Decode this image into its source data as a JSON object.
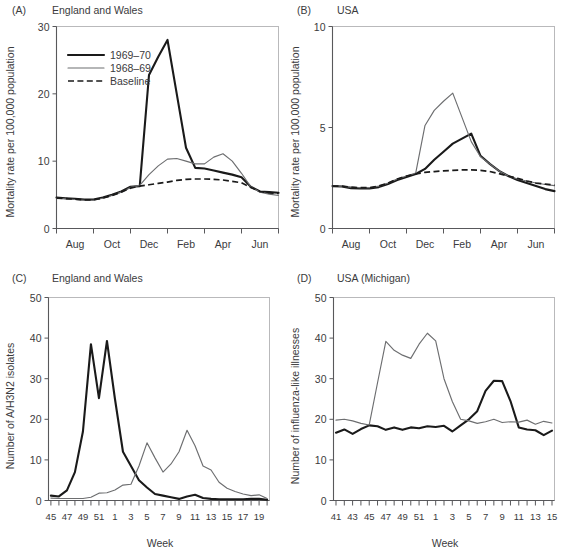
{
  "figure": {
    "panel_tags": {
      "a": "(A)",
      "b": "(B)",
      "c": "(C)",
      "d": "(D)"
    }
  },
  "legend": {
    "items": [
      {
        "label": "1969–70",
        "style": "thick-black",
        "color": "#1a1a1a"
      },
      {
        "label": "1968–69",
        "style": "thin-gray",
        "color": "#6d6e70"
      },
      {
        "label": "Baseline",
        "style": "dashed-black",
        "color": "#1a1a1a"
      }
    ]
  },
  "chart_data": [
    {
      "id": "panel-a",
      "type": "line",
      "panel": "(A)",
      "title": "England and Wales",
      "xlabel": "",
      "ylabel": "Mortality rate per 100,000 population",
      "ylim": [
        0,
        30
      ],
      "yticks": [
        0,
        10,
        20,
        30
      ],
      "ytick_labels": [
        "0",
        "10",
        "20",
        "30"
      ],
      "xlim": [
        0,
        12
      ],
      "xtick_positions": [
        0,
        2,
        4,
        6,
        8,
        10,
        12
      ],
      "xtick_labels": [
        "Aug",
        "Oct",
        "Dec",
        "Feb",
        "Apr",
        "Jun"
      ],
      "xtick_label_positions": [
        1,
        3,
        5,
        7,
        9,
        11
      ],
      "grid": false,
      "legend_position": "upper-left",
      "x": [
        0,
        0.5,
        1,
        1.5,
        2,
        2.5,
        3,
        3.5,
        4,
        4.5,
        5,
        5.5,
        6,
        6.5,
        7,
        7.5,
        8,
        8.5,
        9,
        9.5,
        10,
        10.5,
        11,
        11.5,
        12
      ],
      "series": [
        {
          "name": "1969–70",
          "style": "thick-black",
          "values": [
            4.6,
            4.5,
            4.4,
            4.3,
            4.3,
            4.6,
            5.0,
            5.5,
            6.2,
            6.3,
            22.8,
            25.5,
            28.0,
            20.0,
            12.0,
            9.0,
            8.9,
            8.6,
            8.3,
            8.0,
            7.6,
            6.2,
            5.5,
            5.4,
            5.3
          ]
        },
        {
          "name": "1968–69",
          "style": "thin-gray",
          "values": [
            4.5,
            4.4,
            4.3,
            4.2,
            4.2,
            4.5,
            4.9,
            5.4,
            6.1,
            6.4,
            8.0,
            9.3,
            10.3,
            10.4,
            10.0,
            9.6,
            9.6,
            10.6,
            11.1,
            10.0,
            8.2,
            6.2,
            5.4,
            5.1,
            4.9
          ]
        },
        {
          "name": "Baseline",
          "style": "dashed-black",
          "values": [
            4.5,
            4.45,
            4.35,
            4.25,
            4.25,
            4.5,
            4.9,
            5.4,
            6.0,
            6.3,
            6.5,
            6.7,
            6.9,
            7.15,
            7.3,
            7.35,
            7.35,
            7.3,
            7.2,
            7.0,
            6.8,
            6.1,
            5.5,
            5.3,
            5.2
          ]
        }
      ]
    },
    {
      "id": "panel-b",
      "type": "line",
      "panel": "(B)",
      "title": "USA",
      "xlabel": "",
      "ylabel": "Mortality rate per 100,000 population",
      "ylim": [
        0,
        10
      ],
      "yticks": [
        0,
        5,
        10
      ],
      "ytick_labels": [
        "0",
        "5",
        "10"
      ],
      "xlim": [
        0,
        12
      ],
      "xtick_positions": [
        0,
        2,
        4,
        6,
        8,
        10,
        12
      ],
      "xtick_labels": [
        "Aug",
        "Oct",
        "Dec",
        "Feb",
        "Apr",
        "Jun"
      ],
      "xtick_label_positions": [
        1,
        3,
        5,
        7,
        9,
        11
      ],
      "grid": false,
      "legend_position": "none",
      "x": [
        0,
        0.5,
        1,
        1.5,
        2,
        2.5,
        3,
        3.5,
        4,
        4.5,
        5,
        5.5,
        6,
        6.5,
        7,
        7.5,
        8,
        8.5,
        9,
        9.5,
        10,
        10.5,
        11,
        11.5,
        12
      ],
      "series": [
        {
          "name": "1969–70",
          "style": "thick-black",
          "values": [
            2.1,
            2.08,
            2.0,
            1.98,
            1.98,
            2.05,
            2.2,
            2.4,
            2.55,
            2.7,
            2.95,
            3.4,
            3.8,
            4.2,
            4.45,
            4.7,
            3.6,
            3.2,
            2.85,
            2.6,
            2.4,
            2.25,
            2.1,
            1.95,
            1.85
          ]
        },
        {
          "name": "1968–69",
          "style": "thin-gray",
          "values": [
            2.1,
            2.1,
            2.05,
            2.02,
            2.02,
            2.1,
            2.25,
            2.45,
            2.6,
            2.75,
            5.1,
            5.85,
            6.3,
            6.7,
            5.5,
            4.3,
            3.55,
            3.2,
            2.85,
            2.6,
            2.45,
            2.35,
            2.25,
            2.18,
            2.12
          ]
        },
        {
          "name": "Baseline",
          "style": "dashed-black",
          "values": [
            2.1,
            2.1,
            2.05,
            2.02,
            2.02,
            2.1,
            2.25,
            2.45,
            2.6,
            2.7,
            2.78,
            2.82,
            2.85,
            2.88,
            2.9,
            2.9,
            2.88,
            2.82,
            2.72,
            2.6,
            2.48,
            2.35,
            2.25,
            2.2,
            2.15
          ]
        }
      ]
    },
    {
      "id": "panel-c",
      "type": "line",
      "panel": "(C)",
      "title": "England and Wales",
      "xlabel": "Week",
      "ylabel": "Number of A/H3N2 isolates",
      "ylim": [
        0,
        50
      ],
      "yticks": [
        0,
        10,
        20,
        30,
        40,
        50
      ],
      "ytick_labels": [
        "0",
        "10",
        "20",
        "30",
        "40",
        "50"
      ],
      "xtick_labels": [
        "45",
        "47",
        "49",
        "51",
        "1",
        "3",
        "5",
        "7",
        "9",
        "11",
        "13",
        "15",
        "17",
        "19"
      ],
      "week_sequence": [
        45,
        46,
        47,
        48,
        49,
        50,
        51,
        52,
        1,
        2,
        3,
        4,
        5,
        6,
        7,
        8,
        9,
        10,
        11,
        12,
        13,
        14,
        15,
        16,
        17,
        18,
        19,
        20
      ],
      "grid": false,
      "legend_position": "none",
      "series": [
        {
          "name": "1969–70",
          "style": "thick-black",
          "values": [
            1.2,
            1.0,
            2.5,
            7.0,
            17.0,
            38.5,
            25.2,
            39.3,
            25.0,
            12.0,
            8.5,
            5.0,
            3.2,
            1.6,
            1.2,
            0.8,
            0.4,
            1.0,
            1.4,
            0.6,
            0.4,
            0.3,
            0.3,
            0.3,
            0.3,
            0.4,
            0.4,
            0.2
          ]
        },
        {
          "name": "1968–69",
          "style": "thin-gray",
          "values": [
            0.6,
            0.5,
            0.5,
            0.5,
            0.5,
            0.8,
            1.8,
            1.9,
            2.6,
            3.8,
            4.0,
            8.5,
            14.2,
            10.5,
            7.0,
            9.0,
            12.0,
            17.3,
            13.5,
            8.5,
            7.5,
            4.5,
            3.0,
            2.2,
            1.6,
            1.2,
            1.4,
            0.5
          ]
        }
      ]
    },
    {
      "id": "panel-d",
      "type": "line",
      "panel": "(D)",
      "title": "USA (Michigan)",
      "xlabel": "Week",
      "ylabel": "Number of influenza-like illnesses",
      "ylim": [
        0,
        50
      ],
      "yticks": [
        0,
        10,
        20,
        30,
        40,
        50
      ],
      "ytick_labels": [
        "0",
        "10",
        "20",
        "30",
        "40",
        "50"
      ],
      "xtick_labels": [
        "41",
        "43",
        "45",
        "47",
        "49",
        "51",
        "1",
        "3",
        "5",
        "7",
        "9",
        "11",
        "13",
        "15"
      ],
      "week_sequence": [
        41,
        42,
        43,
        44,
        45,
        46,
        47,
        48,
        49,
        50,
        51,
        52,
        1,
        2,
        3,
        4,
        5,
        6,
        7,
        8,
        9,
        10,
        11,
        12,
        13,
        14,
        15
      ],
      "grid": false,
      "legend_position": "none",
      "series": [
        {
          "name": "1969–70",
          "style": "thick-black",
          "values": [
            16.7,
            17.5,
            16.4,
            17.6,
            18.5,
            18.3,
            17.4,
            18.0,
            17.4,
            18.0,
            17.8,
            18.3,
            18.1,
            18.4,
            17.0,
            18.5,
            20.0,
            22.0,
            27.0,
            29.5,
            29.4,
            24.5,
            18.0,
            17.5,
            17.3,
            16.1,
            17.2
          ]
        },
        {
          "name": "1968–69",
          "style": "thin-gray",
          "values": [
            19.8,
            20.0,
            19.6,
            19.0,
            18.6,
            29.0,
            39.2,
            37.0,
            35.8,
            35.0,
            38.5,
            41.2,
            39.3,
            30.0,
            24.4,
            20.0,
            19.6,
            19.0,
            19.4,
            20.0,
            19.2,
            19.4,
            19.3,
            19.8,
            18.8,
            19.5,
            19.1
          ]
        }
      ]
    }
  ]
}
